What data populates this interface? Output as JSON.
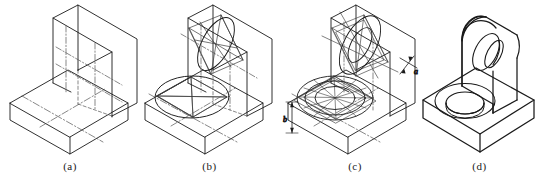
{
  "figure": {
    "background_color": "#ffffff",
    "line_color": "#1a1a1a",
    "construction_line_color": "#555555",
    "width": 541,
    "height": 189
  },
  "panels": [
    {
      "id": "a",
      "caption": "(a)",
      "description": "Isometric box outline of base slab and upright plate with centre lines",
      "elements": [
        "base-slab",
        "upright-plate",
        "centre-lines"
      ]
    },
    {
      "id": "b",
      "caption": "(b)",
      "description": "Four-centre rhombus construction for ellipses on top face and upright face",
      "elements": [
        "base-slab",
        "upright-plate",
        "top-rhombus",
        "top-ellipse",
        "face-rhombus",
        "face-ellipse",
        "construction-lines"
      ]
    },
    {
      "id": "c",
      "caption": "(c)",
      "description": "Concentric ellipses for counterbore and hole, with thickness dimensions a and b",
      "elements": [
        "base-slab",
        "upright-plate",
        "concentric-ellipses",
        "offset-arcs",
        "dimension-a",
        "dimension-b"
      ],
      "dimensions": [
        {
          "name": "a",
          "label": "a",
          "orientation": "oblique",
          "position": "upper-right"
        },
        {
          "name": "b",
          "label": "b",
          "orientation": "vertical",
          "position": "lower-left"
        }
      ]
    },
    {
      "id": "d",
      "caption": "(d)",
      "description": "Finished bracket: base slab with counterbored hole and rounded upright with through hole",
      "elements": [
        "base-slab",
        "counterbore",
        "upright-rounded",
        "through-hole"
      ]
    }
  ]
}
